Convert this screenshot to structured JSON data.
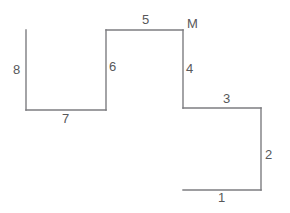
{
  "figure": {
    "canvas": {
      "width": 290,
      "height": 213,
      "background": "#ffffff"
    },
    "stroke": {
      "color": "#7d7d80",
      "width": 1.4
    },
    "text_color": "#58585a",
    "segments": [
      {
        "id": "segment-1",
        "label": "1",
        "orientation": "horizontal",
        "x1": 183,
        "y1": 190,
        "x2": 261,
        "y2": 190,
        "label_x": 218,
        "label_y": 191
      },
      {
        "id": "segment-2",
        "label": "2",
        "orientation": "vertical",
        "x1": 261,
        "y1": 108,
        "x2": 261,
        "y2": 190,
        "label_x": 265,
        "label_y": 148
      },
      {
        "id": "segment-3",
        "label": "3",
        "orientation": "horizontal",
        "x1": 183,
        "y1": 108,
        "x2": 261,
        "y2": 108,
        "label_x": 223,
        "label_y": 92
      },
      {
        "id": "segment-4",
        "label": "4",
        "orientation": "vertical",
        "x1": 183,
        "y1": 30,
        "x2": 183,
        "y2": 108,
        "label_x": 186,
        "label_y": 62
      },
      {
        "id": "segment-5",
        "label": "5",
        "orientation": "horizontal",
        "x1": 106,
        "y1": 30,
        "x2": 183,
        "y2": 30,
        "label_x": 142,
        "label_y": 13
      },
      {
        "id": "segment-6",
        "label": "6",
        "orientation": "vertical",
        "x1": 106,
        "y1": 30,
        "x2": 106,
        "y2": 110,
        "label_x": 109,
        "label_y": 60
      },
      {
        "id": "segment-7",
        "label": "7",
        "orientation": "horizontal",
        "x1": 26,
        "y1": 110,
        "x2": 106,
        "y2": 110,
        "label_x": 62,
        "label_y": 112
      },
      {
        "id": "segment-8",
        "label": "8",
        "orientation": "vertical",
        "x1": 26,
        "y1": 30,
        "x2": 26,
        "y2": 110,
        "label_x": 13,
        "label_y": 63
      }
    ],
    "vertices": [
      {
        "id": "vertex-m",
        "label": "M",
        "x": 183,
        "y": 30,
        "label_x": 187,
        "label_y": 17
      }
    ]
  }
}
